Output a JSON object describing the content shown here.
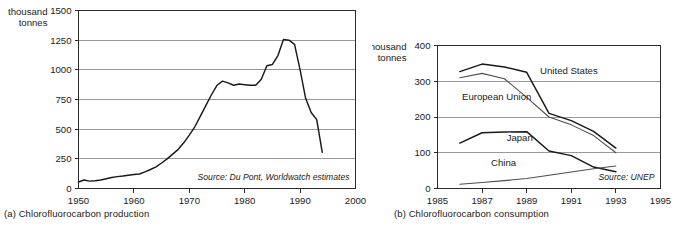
{
  "figures": [
    {
      "id": "a",
      "caption": "(a) Chlorofluorocarbon production",
      "axis_title_line1": "thousand",
      "axis_title_line2": "tonnes",
      "source": "Source: Du Pont, Worldwatch estimates"
    },
    {
      "id": "b",
      "caption": "(b) Chlorofluorocarbon consumption",
      "axis_title_line1": "thousand",
      "axis_title_line2": "tonnes",
      "source": "Source: UNEP"
    }
  ],
  "chart_data": [
    {
      "type": "line",
      "title": "(a) Chlorofluorocarbon production",
      "xlabel": "",
      "ylabel": "thousand tonnes",
      "xlim": [
        1950,
        2000
      ],
      "ylim": [
        0,
        1500
      ],
      "xticks": [
        1950,
        1960,
        1970,
        1980,
        1990,
        2000
      ],
      "yticks": [
        0,
        250,
        500,
        750,
        1000,
        1250,
        1500
      ],
      "grid": "horizontal",
      "legend": "none",
      "annotations": [
        "Source: Du Pont, Worldwatch estimates"
      ],
      "series": [
        {
          "name": "CFC production",
          "color": "#1a1a1a",
          "x": [
            1950,
            1951,
            1952,
            1953,
            1954,
            1955,
            1956,
            1957,
            1958,
            1959,
            1960,
            1961,
            1962,
            1963,
            1964,
            1965,
            1966,
            1967,
            1968,
            1969,
            1970,
            1971,
            1972,
            1973,
            1974,
            1975,
            1976,
            1977,
            1978,
            1979,
            1980,
            1981,
            1982,
            1983,
            1984,
            1985,
            1986,
            1987,
            1988,
            1989,
            1990,
            1991,
            1992,
            1993,
            1994
          ],
          "values": [
            55,
            72,
            62,
            65,
            72,
            82,
            92,
            100,
            105,
            112,
            118,
            122,
            140,
            160,
            182,
            215,
            250,
            290,
            330,
            385,
            450,
            520,
            610,
            700,
            790,
            870,
            905,
            890,
            870,
            880,
            875,
            870,
            870,
            920,
            1035,
            1045,
            1120,
            1255,
            1250,
            1215,
            1000,
            760,
            640,
            580,
            305
          ]
        }
      ]
    },
    {
      "type": "line",
      "title": "(b) Chlorofluorocarbon consumption",
      "xlabel": "",
      "ylabel": "thousand tonnes",
      "xlim": [
        1985,
        1995
      ],
      "ylim": [
        0,
        400
      ],
      "xticks": [
        1985,
        1987,
        1989,
        1991,
        1993,
        1995
      ],
      "yticks": [
        0,
        100,
        200,
        300,
        400
      ],
      "grid": "horizontal",
      "legend": "inline-labels",
      "annotations": [
        "Source: UNEP"
      ],
      "series": [
        {
          "name": "United States",
          "color": "#1a1a1a",
          "label_x": 1989.6,
          "label_y": 320,
          "x": [
            1986,
            1987,
            1988,
            1989,
            1990,
            1991,
            1992,
            1993
          ],
          "values": [
            327,
            348,
            340,
            325,
            210,
            190,
            160,
            113
          ]
        },
        {
          "name": "European Union",
          "color": "#4d4d4d",
          "label_x": 1986.1,
          "label_y": 248,
          "x": [
            1986,
            1987,
            1988,
            1989,
            1990,
            1991,
            1992,
            1993
          ],
          "values": [
            310,
            322,
            307,
            255,
            200,
            178,
            148,
            100
          ]
        },
        {
          "name": "Japan",
          "color": "#1a1a1a",
          "label_x": 1988.1,
          "label_y": 133,
          "x": [
            1986,
            1987,
            1988,
            1989,
            1990,
            1991,
            1992,
            1993
          ],
          "values": [
            127,
            156,
            158,
            159,
            105,
            92,
            60,
            47
          ]
        },
        {
          "name": "China",
          "color": "#4d4d4d",
          "label_x": 1987.4,
          "label_y": 62,
          "x": [
            1986,
            1987,
            1988,
            1989,
            1990,
            1991,
            1992,
            1993
          ],
          "values": [
            12,
            17,
            22,
            28,
            37,
            46,
            55,
            63
          ]
        }
      ]
    }
  ]
}
